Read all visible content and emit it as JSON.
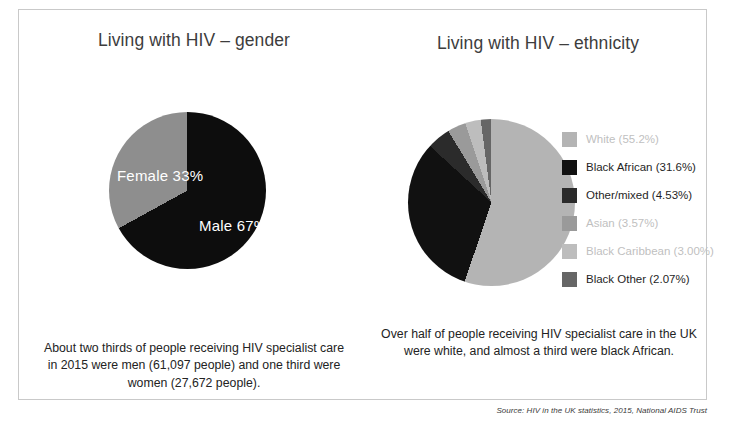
{
  "panels": {
    "gender": {
      "title": "Living with HIV – gender",
      "caption": "About two thirds of people receiving HIV specialist care in 2015 were men (61,097 people) and one third were women (27,672 people).",
      "labels": {
        "female": "Female 33%",
        "male": "Male 67%"
      }
    },
    "ethnicity": {
      "title": "Living with HIV – ethnicity",
      "caption": "Over half of people receiving HIV specialist care in the UK were white, and almost a third were black African.",
      "legend": [
        {
          "label": "White (55.2%)",
          "color": "#b4b4b4",
          "faded": true
        },
        {
          "label": "Black African (31.6%)",
          "color": "#111111",
          "faded": false
        },
        {
          "label": "Other/mixed (4.53%)",
          "color": "#2b2b2b",
          "faded": false
        },
        {
          "label": "Asian (3.57%)",
          "color": "#9a9a9a",
          "faded": true
        },
        {
          "label": "Black Caribbean (3.00%)",
          "color": "#bdbdbd",
          "faded": true
        },
        {
          "label": "Black Other (2.07%)",
          "color": "#666666",
          "faded": false
        }
      ]
    }
  },
  "source": "Source: HIV in the UK statistics, 2015, National AIDS Trust",
  "chart_data": [
    {
      "type": "pie",
      "title": "Living with HIV – gender",
      "categories": [
        "Male",
        "Female"
      ],
      "values": [
        67,
        33
      ],
      "value_unit": "percent",
      "counts": [
        61097,
        27672
      ],
      "colors": [
        "#0d0d0d",
        "#8e8e8e"
      ],
      "data_labels": [
        "Male 67%",
        "Female 33%"
      ],
      "legend": false,
      "start_angle_deg": 0,
      "direction": "clockwise"
    },
    {
      "type": "pie",
      "title": "Living with HIV – ethnicity",
      "categories": [
        "White",
        "Black African",
        "Other/mixed",
        "Asian",
        "Black Caribbean",
        "Black Other"
      ],
      "values": [
        55.2,
        31.6,
        4.53,
        3.57,
        3.0,
        2.07
      ],
      "value_unit": "percent",
      "colors": [
        "#b4b4b4",
        "#111111",
        "#2b2b2b",
        "#9a9a9a",
        "#bdbdbd",
        "#666666"
      ],
      "legend": true,
      "legend_position": "right",
      "start_angle_deg": 0,
      "direction": "clockwise"
    }
  ]
}
